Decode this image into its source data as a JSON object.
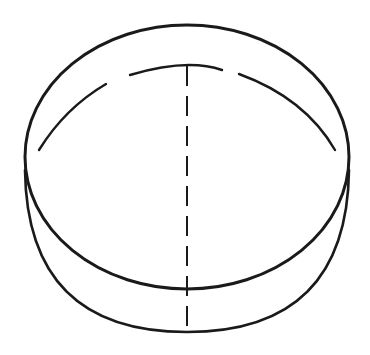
{
  "diagram": {
    "stroke_color": "#1a1a1a",
    "background": "#ffffff",
    "top_ellipse": {
      "cx": 187,
      "cy": 157,
      "rx": 162,
      "ry": 132
    },
    "bottom_offset": 42,
    "axis": {
      "x": 187,
      "y1": 66,
      "y2": 332,
      "dash": "20 10"
    }
  }
}
